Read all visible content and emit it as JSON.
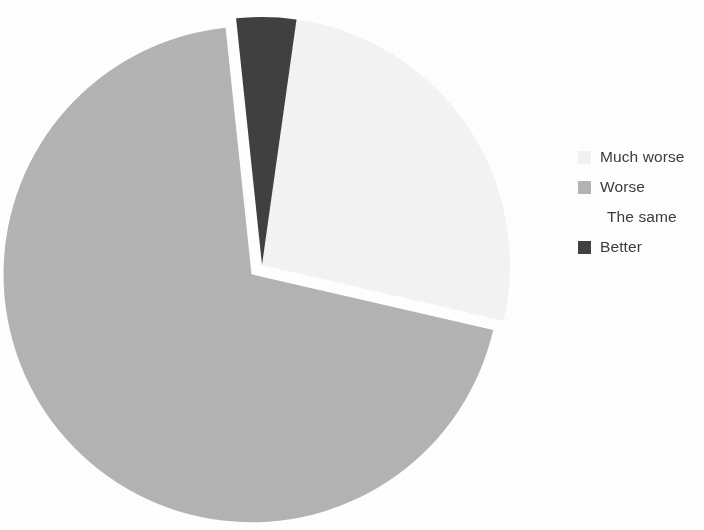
{
  "figure": {
    "background_color": "#ffffff",
    "text_color": "#3c3c3c"
  },
  "legend": {
    "position": "right",
    "items": [
      {
        "label": "Much worse",
        "color": "#f2f2f2",
        "swatch_visible": true
      },
      {
        "label": "Worse",
        "color": "#b4b4b4",
        "swatch_visible": true
      },
      {
        "label": "The same",
        "color": "#ffffff",
        "swatch_visible": false
      },
      {
        "label": "Better",
        "color": "#404040",
        "swatch_visible": true
      }
    ]
  },
  "chart_data": {
    "type": "pie",
    "title": "",
    "subtitle": "",
    "xlabel": "",
    "ylabel": "",
    "grid": false,
    "legend_position": "right",
    "center": {
      "x": 262,
      "y": 265
    },
    "radius": 248,
    "start_angle_deg": -6,
    "direction": "clockwise",
    "categories": [
      "Much worse",
      "Worse",
      "The same",
      "Better"
    ],
    "values": [
      0,
      69,
      26,
      5
    ],
    "unit": "percent",
    "colors": [
      "#f2f2f2",
      "#b4b4b4",
      "#f4f4f4",
      "#404040"
    ],
    "slices": [
      {
        "label": "Much worse",
        "value": 0,
        "color": "#f2f2f2",
        "start_angle_deg": 0,
        "end_angle_deg": 0,
        "exploded": false,
        "explode_offset": 0,
        "visible": false
      },
      {
        "label": "Worse",
        "value": 69,
        "color": "#b4b4b4",
        "start_angle_deg": 103,
        "end_angle_deg": 354,
        "exploded": true,
        "explode_offset": 14,
        "visible": true
      },
      {
        "label": "The same",
        "value": 26,
        "color": "#f4f4f4",
        "start_angle_deg": 8,
        "end_angle_deg": 103,
        "exploded": false,
        "explode_offset": 0,
        "visible": true
      },
      {
        "label": "Better",
        "value": 5,
        "color": "#404040",
        "start_angle_deg": 354,
        "end_angle_deg": 368,
        "exploded": false,
        "explode_offset": 0,
        "visible": true
      }
    ],
    "annotations": []
  }
}
